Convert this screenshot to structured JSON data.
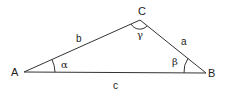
{
  "diagram": {
    "type": "triangle",
    "vertices": {
      "A": {
        "label": "A",
        "x": 24,
        "y": 72
      },
      "B": {
        "label": "B",
        "x": 206,
        "y": 73
      },
      "C": {
        "label": "C",
        "x": 140,
        "y": 20
      }
    },
    "sides": {
      "a": {
        "label": "a",
        "between": "B-C"
      },
      "b": {
        "label": "b",
        "between": "A-C"
      },
      "c": {
        "label": "c",
        "between": "A-B"
      }
    },
    "angles": {
      "alpha": {
        "label": "α",
        "at": "A"
      },
      "beta": {
        "label": "β",
        "at": "B"
      },
      "gamma": {
        "label": "γ",
        "at": "C"
      }
    },
    "colors": {
      "stroke": "#333333",
      "text": "#222222",
      "background": "#ffffff"
    }
  }
}
